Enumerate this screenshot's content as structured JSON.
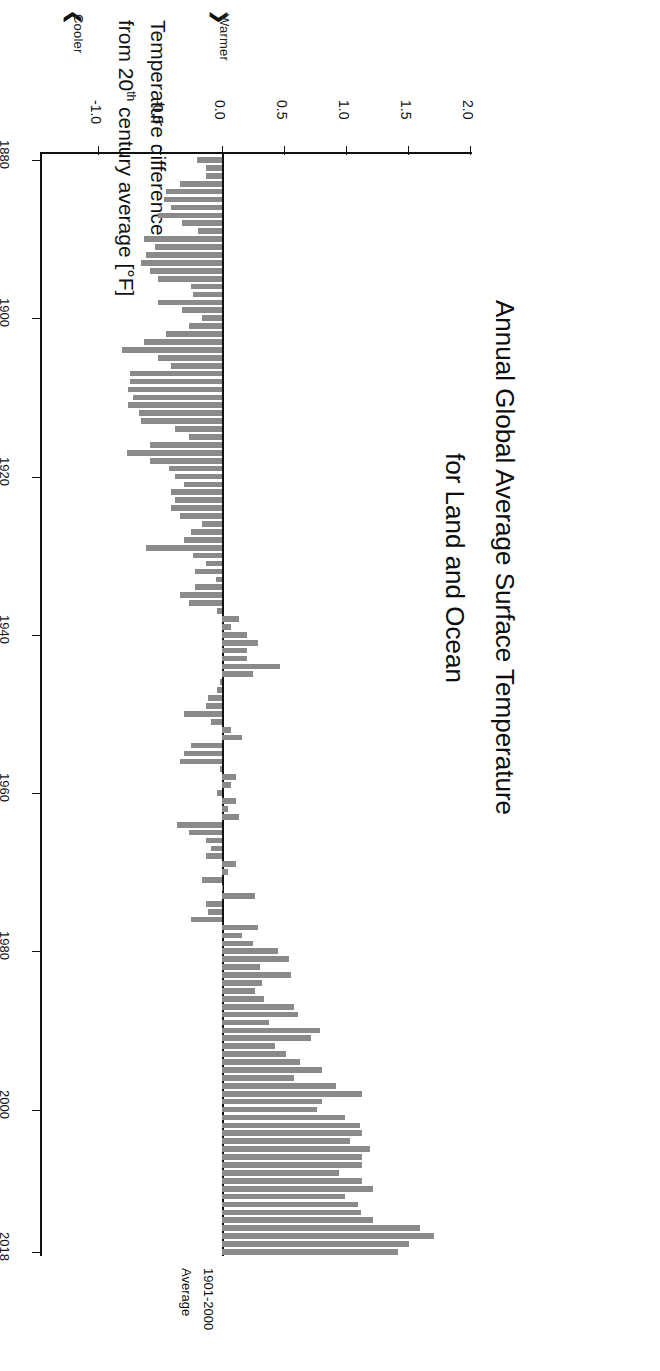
{
  "chart": {
    "title_line1": "Annual Global Average Surface Temperature",
    "title_line2": "for Land and Ocean",
    "axis_title_line1": "Temperature difference",
    "axis_title_line2": "from 20",
    "axis_title_sup": "th",
    "axis_title_line2b": " century average [°F]",
    "cooler_label": "Cooler",
    "warmer_label": "Warmer",
    "cooler_arrow": "❮",
    "warmer_arrow": "❯",
    "baseline_line1": "1901-2000",
    "baseline_line2": "Average",
    "bar_color": "#8a8a8a",
    "axis_color": "#111111",
    "background": "#ffffff"
  },
  "chart_data": {
    "type": "bar",
    "orientation": "horizontal",
    "title": "Annual Global Average Surface Temperature for Land and Ocean",
    "xlabel": "Temperature difference from 20th century average [°F]",
    "ylabel": "Year",
    "xlim": [
      -1.0,
      2.0
    ],
    "xticks": [
      -1.0,
      -0.5,
      0.0,
      0.5,
      1.0,
      1.5,
      2.0
    ],
    "xticklabels": [
      "-1.0",
      "-0.5",
      "0.0",
      "0.5",
      "1.0",
      "1.5",
      "2.0"
    ],
    "yticks": [
      1880,
      1900,
      1920,
      1940,
      1960,
      1980,
      2000,
      2018
    ],
    "yticklabels": [
      "1880",
      "1900",
      "1920",
      "1940",
      "1960",
      "1980",
      "2000",
      "2018"
    ],
    "ylim": [
      1880,
      2018
    ],
    "grid": false,
    "legend": null,
    "baseline": 0.0,
    "baseline_label": "1901-2000 Average",
    "units": "degrees Fahrenheit",
    "categories": [
      1880,
      1881,
      1882,
      1883,
      1884,
      1885,
      1886,
      1887,
      1888,
      1889,
      1890,
      1891,
      1892,
      1893,
      1894,
      1895,
      1896,
      1897,
      1898,
      1899,
      1900,
      1901,
      1902,
      1903,
      1904,
      1905,
      1906,
      1907,
      1908,
      1909,
      1910,
      1911,
      1912,
      1913,
      1914,
      1915,
      1916,
      1917,
      1918,
      1919,
      1920,
      1921,
      1922,
      1923,
      1924,
      1925,
      1926,
      1927,
      1928,
      1929,
      1930,
      1931,
      1932,
      1933,
      1934,
      1935,
      1936,
      1937,
      1938,
      1939,
      1940,
      1941,
      1942,
      1943,
      1944,
      1945,
      1946,
      1947,
      1948,
      1949,
      1950,
      1951,
      1952,
      1953,
      1954,
      1955,
      1956,
      1957,
      1958,
      1959,
      1960,
      1961,
      1962,
      1963,
      1964,
      1965,
      1966,
      1967,
      1968,
      1969,
      1970,
      1971,
      1972,
      1973,
      1974,
      1975,
      1976,
      1977,
      1978,
      1979,
      1980,
      1981,
      1982,
      1983,
      1984,
      1985,
      1986,
      1987,
      1988,
      1989,
      1990,
      1991,
      1992,
      1993,
      1994,
      1995,
      1996,
      1997,
      1998,
      1999,
      2000,
      2001,
      2002,
      2003,
      2004,
      2005,
      2006,
      2007,
      2008,
      2009,
      2010,
      2011,
      2012,
      2013,
      2014,
      2015,
      2016,
      2017,
      2018
    ],
    "values": [
      -0.2,
      -0.13,
      -0.13,
      -0.34,
      -0.45,
      -0.47,
      -0.41,
      -0.52,
      -0.32,
      -0.19,
      -0.63,
      -0.54,
      -0.61,
      -0.65,
      -0.58,
      -0.52,
      -0.25,
      -0.23,
      -0.52,
      -0.32,
      -0.16,
      -0.27,
      -0.45,
      -0.63,
      -0.81,
      -0.52,
      -0.41,
      -0.74,
      -0.74,
      -0.76,
      -0.72,
      -0.76,
      -0.67,
      -0.65,
      -0.38,
      -0.27,
      -0.58,
      -0.77,
      -0.58,
      -0.43,
      -0.38,
      -0.31,
      -0.41,
      -0.38,
      -0.41,
      -0.34,
      -0.16,
      -0.25,
      -0.31,
      -0.61,
      -0.23,
      -0.13,
      -0.22,
      -0.05,
      -0.22,
      -0.34,
      -0.27,
      -0.04,
      0.14,
      0.07,
      0.2,
      0.29,
      0.2,
      0.2,
      0.47,
      0.25,
      -0.02,
      -0.04,
      -0.11,
      -0.13,
      -0.31,
      -0.09,
      0.07,
      0.16,
      -0.25,
      -0.31,
      -0.34,
      -0.02,
      0.11,
      0.07,
      -0.04,
      0.11,
      0.05,
      0.14,
      -0.36,
      -0.27,
      -0.13,
      -0.09,
      -0.13,
      0.11,
      0.05,
      -0.16,
      0.0,
      0.27,
      -0.13,
      -0.11,
      -0.25,
      0.29,
      0.16,
      0.25,
      0.45,
      0.54,
      0.31,
      0.56,
      0.32,
      0.27,
      0.34,
      0.58,
      0.61,
      0.38,
      0.79,
      0.72,
      0.43,
      0.52,
      0.63,
      0.81,
      0.58,
      0.92,
      1.13,
      0.81,
      0.77,
      0.99,
      1.11,
      1.13,
      1.03,
      1.19,
      1.13,
      1.13,
      0.94,
      1.13,
      1.22,
      0.99,
      1.1,
      1.12,
      1.22,
      1.6,
      1.71,
      1.51,
      1.42
    ]
  }
}
